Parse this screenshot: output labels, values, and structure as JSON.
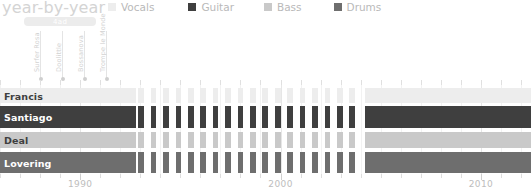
{
  "header": {
    "title": "year-by-year"
  },
  "legend": {
    "position": "top-right",
    "items": [
      {
        "label": "Vocals",
        "color": "#ededed",
        "icon": "legend-swatch"
      },
      {
        "label": "Guitar",
        "color": "#3f3f3f",
        "icon": "legend-swatch"
      },
      {
        "label": "Bass",
        "color": "#c9c9c9",
        "icon": "legend-swatch"
      },
      {
        "label": "Drums",
        "color": "#6e6e6e",
        "icon": "legend-swatch"
      }
    ]
  },
  "annotations": {
    "label_box": {
      "text": "4ad",
      "start_year": 1987.2,
      "end_year": 1990.8
    },
    "events": [
      {
        "text": "Surfer Rosa",
        "year": 1988.0
      },
      {
        "text": "Doolittle",
        "year": 1989.1
      },
      {
        "text": "Bossanova",
        "year": 1990.2
      },
      {
        "text": "Trompe le Monde",
        "year": 1991.3
      }
    ]
  },
  "chart_data": {
    "type": "bar",
    "subtype": "timeline-gantt",
    "title": "year-by-year",
    "xlabel": "",
    "ylabel": "",
    "xlim": [
      1986.0,
      2012.5
    ],
    "grid": true,
    "x_ticks": [
      1986,
      1987,
      1988,
      1989,
      1990,
      1991,
      1992,
      1993,
      1994,
      1995,
      1996,
      1997,
      1998,
      1999,
      2000,
      2001,
      2002,
      2003,
      2004,
      2005,
      2006,
      2007,
      2008,
      2009,
      2010,
      2011,
      2012
    ],
    "x_tick_labels": [
      {
        "value": 1990,
        "label": "1990"
      },
      {
        "value": 2000,
        "label": "2000"
      },
      {
        "value": 2010,
        "label": "2010"
      }
    ],
    "categories": [
      "Francis",
      "Santiago",
      "Deal",
      "Lovering"
    ],
    "series": [
      {
        "name": "Vocals",
        "category": "Francis",
        "color": "#ededed",
        "label_color": "#3f3f3f",
        "row_top": 4,
        "row_height": 15,
        "spans": [
          {
            "start": 1986.0,
            "end": 1992.8,
            "style": "solid"
          },
          {
            "start": 2004.2,
            "end": 2012.5,
            "style": "solid"
          }
        ],
        "striped": {
          "start": 1992.9,
          "end": 2004.1,
          "period": 0.62,
          "duty": 0.46
        }
      },
      {
        "name": "Guitar",
        "category": "Santiago",
        "color": "#3f3f3f",
        "label_color": "#ffffff",
        "row_top": 22,
        "row_height": 22,
        "spans": [
          {
            "start": 1986.0,
            "end": 1992.8,
            "style": "solid"
          },
          {
            "start": 2004.2,
            "end": 2012.5,
            "style": "solid"
          }
        ],
        "striped": {
          "start": 1992.9,
          "end": 2004.1,
          "period": 0.62,
          "duty": 0.46
        }
      },
      {
        "name": "Bass",
        "category": "Deal",
        "color": "#c9c9c9",
        "label_color": "#3f3f3f",
        "row_top": 48,
        "row_height": 16,
        "spans": [
          {
            "start": 1986.0,
            "end": 1992.8,
            "style": "solid"
          },
          {
            "start": 2004.2,
            "end": 2012.5,
            "style": "solid"
          }
        ],
        "striped": {
          "start": 1992.9,
          "end": 2004.1,
          "period": 0.62,
          "duty": 0.46
        }
      },
      {
        "name": "Drums",
        "category": "Lovering",
        "color": "#6e6e6e",
        "label_color": "#ffffff",
        "row_top": 68,
        "row_height": 21,
        "spans": [
          {
            "start": 1986.0,
            "end": 1992.8,
            "style": "solid"
          },
          {
            "start": 2004.2,
            "end": 2012.5,
            "style": "solid"
          }
        ],
        "striped": {
          "start": 1992.9,
          "end": 2004.1,
          "period": 0.62,
          "duty": 0.46
        }
      }
    ]
  }
}
